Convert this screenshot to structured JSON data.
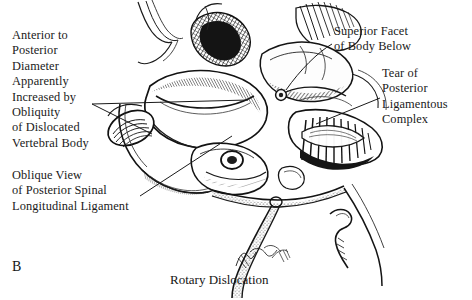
{
  "figure": {
    "panel_label": "B",
    "caption": "Rotary Dislocation",
    "background_color": "#ffffff",
    "ink_color": "#1a1a1a",
    "width": 472,
    "height": 300
  },
  "annotations": {
    "anterior_posterior_diameter": {
      "text": "Anterior to\nPosterior\nDiameter\nApparently\nIncreased by\nObliquity\nof Dislocated\nVertebral Body",
      "position": "left-upper",
      "leader": "two-lines-to-vertebral-body"
    },
    "oblique_view": {
      "text": "Oblique View\nof Posterior Spinal\nLongitudinal Ligament",
      "position": "left-lower",
      "leader": "single-line-up-right"
    },
    "superior_facet": {
      "text": "Superior Facet\nof Body Below",
      "position": "right-upper",
      "leader": "single-line-down-left"
    },
    "tear_posterior_ligamentous": {
      "text": "Tear of\nPosterior\nLigamentous\nComplex",
      "position": "right-middle",
      "leader": "single-line-down-left"
    }
  },
  "artist_signature": {
    "present": true,
    "legible": false,
    "position": "bottom-center"
  }
}
